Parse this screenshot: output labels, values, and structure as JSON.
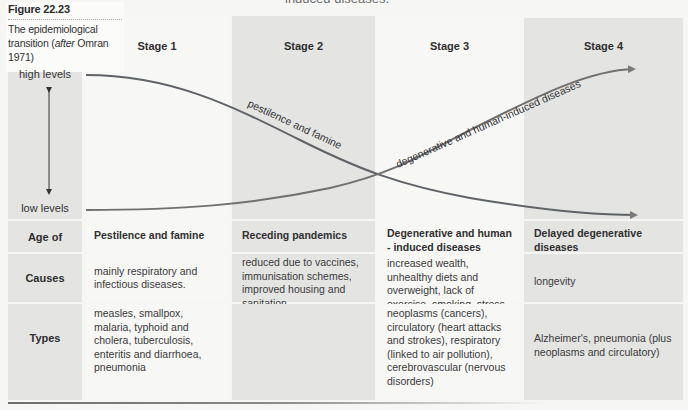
{
  "top_cut_text": "induced diseases.",
  "figure": {
    "number": "Figure 22.23",
    "caption_prefix": "The epidemiological transition (",
    "caption_italic": "after",
    "caption_suffix": " Omran 1971)"
  },
  "axis": {
    "high_label": "high levels",
    "low_label": "low levels"
  },
  "stages": [
    {
      "label": "Stage 1"
    },
    {
      "label": "Stage 2"
    },
    {
      "label": "Stage 3"
    },
    {
      "label": "Stage 4"
    }
  ],
  "curves": {
    "pestilence": {
      "label": "pestilence and famine",
      "color": "#5f6266"
    },
    "degenerative": {
      "label": "degenerative and human-induced diseases",
      "color": "#707070"
    }
  },
  "colors": {
    "grey_column": "#e4e4e3",
    "white_column": "#f7f7f6"
  },
  "table": {
    "rows": [
      {
        "label": "Age of",
        "cells": [
          "Pestilence and famine",
          "Receding pandemics",
          "Degenerative and human - induced diseases",
          "Delayed degenerative diseases"
        ]
      },
      {
        "label": "Causes",
        "cells": [
          "mainly respiratory and infectious diseases.",
          "reduced due to vaccines, immunisation schemes, improved housing and sanitation",
          "increased wealth, unhealthy diets and overweight, lack of exercise, smoking, stress",
          "longevity"
        ]
      },
      {
        "label": "Types",
        "cells": [
          "measles, smallpox, malaria, typhoid and cholera, tuberculosis, enteritis and diarrhoea, pneumonia",
          "",
          "neoplasms (cancers), circulatory (heart attacks and strokes), respiratory (linked to air pollution), cerebrovascular (nervous disorders)",
          "Alzheimer's, pneumonia (plus neoplasms and circulatory)"
        ]
      }
    ]
  }
}
